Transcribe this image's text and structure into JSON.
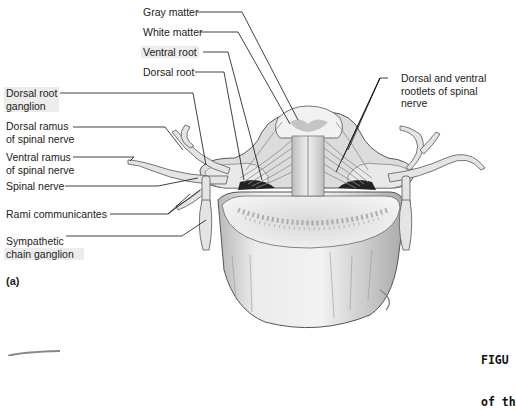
{
  "figure": {
    "panel_label": "(a)",
    "caption_lines": [
      "FIGU",
      "of th"
    ]
  },
  "labels_left": [
    {
      "id": "gray-matter",
      "lines": [
        "Gray matter"
      ]
    },
    {
      "id": "white-matter",
      "lines": [
        "White matter"
      ]
    },
    {
      "id": "ventral-root",
      "lines": [
        "Ventral root"
      ]
    },
    {
      "id": "dorsal-root",
      "lines": [
        "Dorsal root"
      ]
    },
    {
      "id": "dorsal-root-ganglion",
      "lines": [
        "Dorsal root",
        "ganglion"
      ]
    },
    {
      "id": "dorsal-ramus",
      "lines": [
        "Dorsal ramus",
        "of spinal nerve"
      ]
    },
    {
      "id": "ventral-ramus",
      "lines": [
        "Ventral ramus",
        "of spinal nerve"
      ]
    },
    {
      "id": "spinal-nerve",
      "lines": [
        "Spinal nerve"
      ]
    },
    {
      "id": "rami-communicantes",
      "lines": [
        "Rami communicantes"
      ]
    },
    {
      "id": "sympathetic-chain-ganglion",
      "lines": [
        "Sympathetic",
        "chain ganglion"
      ]
    }
  ],
  "labels_right": [
    {
      "id": "rootlets",
      "lines": [
        "Dorsal and ventral",
        "rootlets of spinal",
        "nerve"
      ]
    }
  ]
}
